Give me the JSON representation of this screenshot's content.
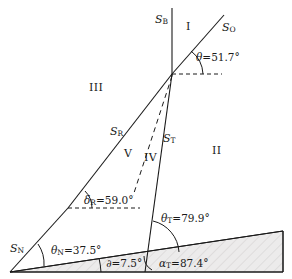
{
  "figure": {
    "type": "geometric-line-diagram",
    "width": 292,
    "height": 279,
    "background": "#ffffff",
    "line_color": "#1a1a1a",
    "shade_fill": "#eceaea",
    "hatch_color": "#c8c6c6"
  },
  "surface_labels": [
    {
      "id": "S_B",
      "base": "S",
      "sub": "B",
      "x": 155,
      "y": 14,
      "name": "label-sb"
    },
    {
      "id": "S_O",
      "base": "S",
      "sub": "O",
      "x": 222,
      "y": 22,
      "name": "label-so"
    },
    {
      "id": "S_R",
      "base": "S",
      "sub": "R",
      "x": 110,
      "y": 126,
      "name": "label-sr"
    },
    {
      "id": "S_T",
      "base": "S",
      "sub": "T",
      "x": 163,
      "y": 133,
      "name": "label-st"
    },
    {
      "id": "S_N",
      "base": "S",
      "sub": "N",
      "x": 10,
      "y": 243,
      "name": "label-sn"
    }
  ],
  "region_labels": [
    {
      "id": "I",
      "text": "I",
      "x": 186,
      "y": 21,
      "name": "region-i"
    },
    {
      "id": "II",
      "text": "II",
      "x": 212,
      "y": 145,
      "name": "region-ii"
    },
    {
      "id": "III",
      "text": "III",
      "x": 89,
      "y": 82,
      "name": "region-iii"
    },
    {
      "id": "IV",
      "text": "IV",
      "x": 144,
      "y": 152,
      "name": "region-iv"
    },
    {
      "id": "V",
      "text": "V",
      "x": 124,
      "y": 148,
      "name": "region-v"
    }
  ],
  "angle_labels": [
    {
      "id": "theta",
      "glyph": "θ",
      "sub": "",
      "value": "51.7",
      "text": "θ=51.7°",
      "x": 196,
      "y": 52,
      "name": "angle-theta"
    },
    {
      "id": "delta_R",
      "glyph": "δ",
      "sub": "R",
      "value": "59.0",
      "text": "δR=59.0°",
      "x": 84,
      "y": 195,
      "name": "angle-delta-r"
    },
    {
      "id": "theta_T",
      "glyph": "θ",
      "sub": "T",
      "value": "79.9",
      "text": "θT=79.9°",
      "x": 161,
      "y": 213,
      "name": "angle-theta-t"
    },
    {
      "id": "theta_N",
      "glyph": "θ",
      "sub": "N",
      "value": "37.5",
      "text": "θN=37.5°",
      "x": 51,
      "y": 245,
      "name": "angle-theta-n"
    },
    {
      "id": "partial",
      "glyph": "∂",
      "sub": "",
      "value": "7.5",
      "text": "∂=7.5°",
      "x": 106,
      "y": 258,
      "name": "angle-partial"
    },
    {
      "id": "alpha_T",
      "glyph": "α",
      "sub": "T",
      "value": "87.4",
      "text": "αT=87.4°",
      "x": 159,
      "y": 258,
      "name": "angle-alpha-t"
    }
  ],
  "degree_symbol": "°",
  "equals": "="
}
